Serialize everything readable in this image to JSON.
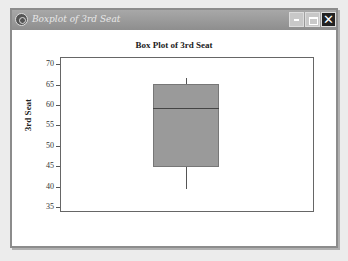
{
  "window": {
    "title": "Boxplot of 3rd Seat",
    "controls": {
      "minimize": "–",
      "maximize": "□",
      "close": "✕"
    }
  },
  "chart_data": {
    "type": "box",
    "title": "Box Plot of 3rd Seat",
    "xlabel": "",
    "ylabel": "3rd Seat",
    "ylim": [
      34,
      71.5
    ],
    "yticks": [
      35,
      40,
      45,
      50,
      55,
      60,
      65,
      70
    ],
    "grid": false,
    "legend": null,
    "series": [
      {
        "name": "3rd Seat",
        "min": 39.5,
        "q1": 44.8,
        "median": 59.3,
        "q3": 65.2,
        "max": 66.7,
        "fill": "#9a9a9a"
      }
    ]
  }
}
